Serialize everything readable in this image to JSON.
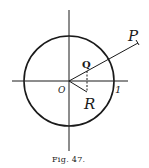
{
  "figure": {
    "caption": "Fig. 47.",
    "labels": {
      "P": "P",
      "Q": "Q",
      "O": "O",
      "R": "R",
      "one": "1"
    }
  },
  "colors": {
    "ink": "#1a1a1a",
    "background": "#ffffff"
  }
}
